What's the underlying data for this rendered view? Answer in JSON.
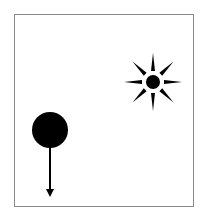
{
  "diagram": {
    "type": "physics-scene",
    "frame": {
      "border_color": "#8a8a8a",
      "background": "#ffffff"
    },
    "objects": [
      {
        "id": "sun",
        "label": "sun",
        "center": [
          153,
          82
        ],
        "core_radius": 7,
        "ray_count": 8,
        "ray_length": 28,
        "color": "#000000"
      },
      {
        "id": "ball",
        "label": "ball",
        "center": [
          50,
          130
        ],
        "radius": 18,
        "color": "#000000"
      },
      {
        "id": "force-arrow",
        "label": "downward force arrow",
        "from": [
          50,
          148
        ],
        "to": [
          50,
          196
        ],
        "direction": "down",
        "color": "#000000"
      }
    ],
    "caption": {
      "visible": "partially cut off, unreadable"
    }
  }
}
